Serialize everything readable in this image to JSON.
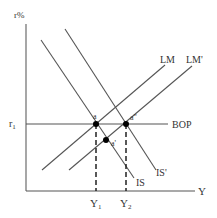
{
  "diagram": {
    "colors": {
      "line": "#555555",
      "axis": "#777777",
      "point": "#000000",
      "text": "#333333",
      "background": "#ffffff"
    },
    "axes": {
      "y_label": "r%",
      "x_label": "Y",
      "y_tick_label": "r",
      "y_tick_sub": "1"
    },
    "curves": {
      "lm": "LM",
      "lm_prime": "LM'",
      "is": "IS",
      "is_prime": "IS'",
      "bop": "BOP"
    },
    "points": {
      "a": "a",
      "a_prime": "a'",
      "a_double_prime": "a\""
    },
    "x_ticks": [
      {
        "label": "Y",
        "sub": "1"
      },
      {
        "label": "Y",
        "sub": "2"
      }
    ]
  }
}
